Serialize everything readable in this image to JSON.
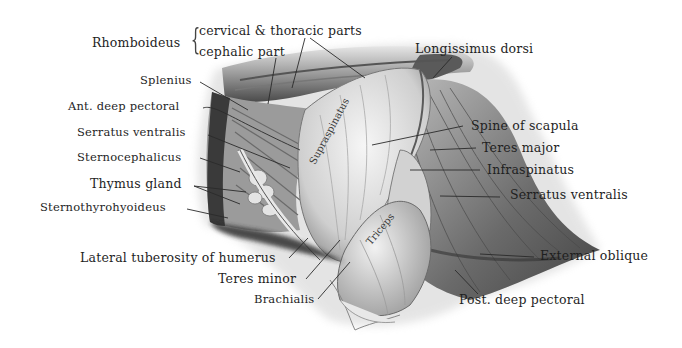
{
  "figure": {
    "labels_left": [
      {
        "id": "rhomboideus",
        "text": "Rhomboideus"
      },
      {
        "id": "rhomboideus-cervical-thoracic",
        "text": "cervical & thoracic parts"
      },
      {
        "id": "rhomboideus-cephalic",
        "text": "cephalic part"
      },
      {
        "id": "splenius",
        "text": "Splenius"
      },
      {
        "id": "ant-deep-pectoral",
        "text": "Ant. deep pectoral"
      },
      {
        "id": "serratus-ventralis-left",
        "text": "Serratus ventralis"
      },
      {
        "id": "sternocephalicus",
        "text": "Sternocephalicus"
      },
      {
        "id": "thymus-gland",
        "text": "Thymus gland"
      },
      {
        "id": "sternothyrohyoideus",
        "text": "Sternothyrohyoideus"
      }
    ],
    "labels_bottom": [
      {
        "id": "lateral-tuberosity",
        "text": "Lateral tuberosity of humerus"
      },
      {
        "id": "teres-minor",
        "text": "Teres minor"
      },
      {
        "id": "brachialis",
        "text": "Brachialis"
      },
      {
        "id": "post-deep-pectoral",
        "text": "Post. deep pectoral"
      }
    ],
    "labels_right": [
      {
        "id": "longissimus-dorsi",
        "text": "Longissimus dorsi"
      },
      {
        "id": "spine-of-scapula",
        "text": "Spine of scapula"
      },
      {
        "id": "teres-major",
        "text": "Teres major"
      },
      {
        "id": "infraspinatus",
        "text": "Infraspinatus"
      },
      {
        "id": "serratus-ventralis-right",
        "text": "Serratus ventralis"
      },
      {
        "id": "external-oblique",
        "text": "External oblique"
      }
    ],
    "labels_inline": [
      {
        "id": "supraspinatus",
        "text": "Supraspinatus"
      },
      {
        "id": "triceps",
        "text": "Triceps"
      }
    ],
    "colors": {
      "background": "#ffffff",
      "ink": "#1f1f1f",
      "shade_dark": "#3c3c3c",
      "shade_mid": "#8a8a8a",
      "shade_light": "#d6d6d6"
    }
  }
}
